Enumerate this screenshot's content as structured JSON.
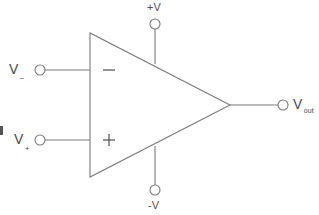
{
  "diagram": {
    "type": "op-amp-symbol",
    "colors": {
      "background": "#ffffff",
      "stroke": "#7a7a7a",
      "text": "#4a4a4a"
    },
    "body": {
      "shape": "triangle",
      "terminal_minus_sign": "−",
      "terminal_plus_sign": "+"
    },
    "labels": {
      "inverting_input": {
        "base": "V",
        "subscript": "−"
      },
      "noninverting_input": {
        "base": "V",
        "subscript": "+"
      },
      "output": {
        "base": "V",
        "subscript": "out"
      },
      "positive_supply": "+V",
      "negative_supply": "-V"
    },
    "terminals": [
      {
        "name": "inverting-input-terminal",
        "x": 40,
        "y": 70
      },
      {
        "name": "noninverting-input-terminal",
        "x": 40,
        "y": 140
      },
      {
        "name": "positive-supply-terminal",
        "x": 155,
        "y": 24
      },
      {
        "name": "negative-supply-terminal",
        "x": 155,
        "y": 190
      },
      {
        "name": "output-terminal",
        "x": 283,
        "y": 105
      }
    ]
  }
}
